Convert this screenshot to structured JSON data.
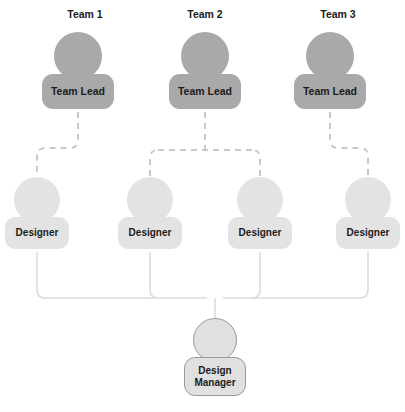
{
  "diagram": {
    "title_row": [
      {
        "label": "Team 1",
        "cx": 85,
        "y": 8
      },
      {
        "label": "Team 2",
        "cx": 205,
        "y": 8
      },
      {
        "label": "Team 3",
        "cx": 338,
        "y": 8
      }
    ],
    "leads": [
      {
        "id": "lead-1",
        "label": "Team Lead",
        "cx": 78,
        "top": 32
      },
      {
        "id": "lead-2",
        "label": "Team Lead",
        "cx": 205,
        "top": 32
      },
      {
        "id": "lead-3",
        "label": "Team Lead",
        "cx": 330,
        "top": 32
      }
    ],
    "designers": [
      {
        "id": "designer-1",
        "label": "Designer",
        "cx": 37,
        "top": 177
      },
      {
        "id": "designer-2",
        "label": "Designer",
        "cx": 150,
        "top": 177
      },
      {
        "id": "designer-3",
        "label": "Designer",
        "cx": 260,
        "top": 177
      },
      {
        "id": "designer-4",
        "label": "Designer",
        "cx": 368,
        "top": 177
      }
    ],
    "manager": {
      "id": "design-manager",
      "line1": "Design",
      "line2": "Manager",
      "cx": 215,
      "top": 318
    },
    "colors": {
      "lead_fill": "#a9a9a9",
      "designer_fill": "#e3e3e3",
      "manager_fill": "#e0e0e0",
      "manager_stroke": "#9a9a9a",
      "dashed_connector": "#c9c9c9",
      "solid_connector": "#dcdcdc",
      "text": "#1b1b1b",
      "background": "#ffffff"
    },
    "connectors": {
      "dashed_paths": [
        "M78,112 L78,140 Q78,148 70,148 L45,148 Q37,148 37,156 L37,176",
        "M205,112 L205,150 M150,156 L150,176 M260,156 L260,176 M158,150 L252,150 M150,156 Q150,150 158,150 M260,156 Q260,150 252,150",
        "M330,112 L330,140 Q330,148 338,148 L360,148 Q368,148 368,156 L368,176"
      ],
      "solid_paths": [
        "M37,252 L37,290 Q37,298 45,298 L207,298 Q215,298 215,306 L215,318",
        "M150,252 L150,290 Q150,298 158,298",
        "M260,252 L260,290 Q260,298 252,298",
        "M368,252 L368,290 Q368,298 360,298 L223,298 Q215,298 215,306"
      ]
    }
  }
}
